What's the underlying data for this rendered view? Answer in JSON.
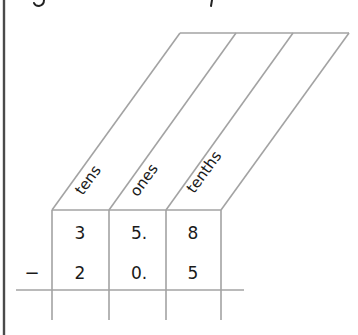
{
  "diagram": {
    "type": "place-value-subtraction",
    "columns": [
      {
        "label": "tens"
      },
      {
        "label": "ones"
      },
      {
        "label": "tenths"
      }
    ],
    "rows": [
      {
        "operator": "",
        "values": [
          "3",
          "5.",
          "8"
        ]
      },
      {
        "operator": "−",
        "values": [
          "2",
          "0.",
          "5"
        ]
      }
    ],
    "answer_row": [
      "",
      "",
      ""
    ],
    "colors": {
      "grid": "#a3a3a3",
      "border": "#4a4a4a",
      "text": "#1a1a1a"
    }
  }
}
